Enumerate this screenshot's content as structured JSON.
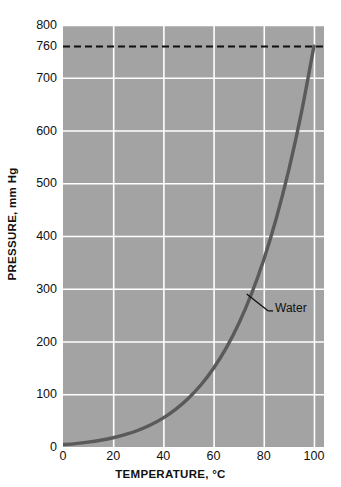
{
  "chart_data": {
    "type": "line",
    "title": "",
    "xlabel": "TEMPERATURE, °C",
    "ylabel": "PRESSURE, mm Hg",
    "xlim": [
      0,
      104
    ],
    "ylim": [
      0,
      800
    ],
    "grid": true,
    "legend": "none",
    "plot_background": "#a3a3a3",
    "gridline_color": "#ffffff",
    "curve_color": "#5a5a5a",
    "reference_line_color": "#111111",
    "xticks": [
      0,
      20,
      40,
      60,
      80,
      100
    ],
    "xtick_labels": [
      "0",
      "20",
      "40",
      "60",
      "80",
      "100"
    ],
    "yticks": [
      0,
      100,
      200,
      300,
      400,
      500,
      600,
      700,
      800
    ],
    "ytick_labels": [
      "0",
      "100",
      "200",
      "300",
      "400",
      "500",
      "600",
      "700",
      "800"
    ],
    "extra_ytick": {
      "value": 760,
      "label": "760"
    },
    "reference_line": {
      "y": 760,
      "style": "dashed",
      "label": "760"
    },
    "series": [
      {
        "name": "Water",
        "annotation": "Water",
        "x": [
          0,
          5,
          10,
          15,
          20,
          25,
          30,
          35,
          40,
          45,
          50,
          55,
          60,
          65,
          70,
          75,
          80,
          85,
          90,
          95,
          100
        ],
        "values": [
          4.6,
          6.5,
          9.2,
          12.8,
          17.5,
          23.8,
          31.8,
          42.2,
          55.3,
          71.9,
          92.5,
          118.0,
          149.4,
          187.5,
          233.7,
          289.1,
          355.1,
          433.6,
          525.8,
          633.9,
          760.0
        ]
      }
    ],
    "annotations": [
      {
        "text": "Water",
        "text_x": 84.5,
        "text_y": 262,
        "leader_from_x": 73.2,
        "leader_from_y": 290,
        "leader_to_x": 81.8,
        "leader_to_y": 258
      }
    ]
  },
  "axis": {
    "y_title": "PRESSURE, mm Hg",
    "x_title": "TEMPERATURE, °C"
  }
}
